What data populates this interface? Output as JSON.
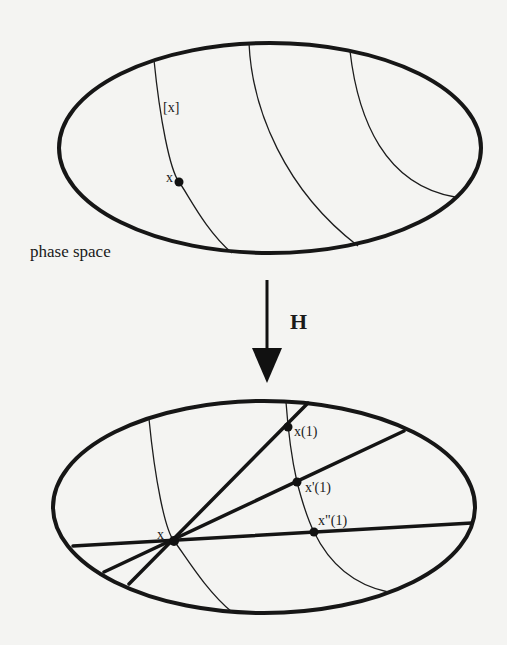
{
  "figure": {
    "top_panel": {
      "caption": "phase space",
      "fiber_label": "[x]",
      "point_label": "x"
    },
    "map": {
      "label": "H"
    },
    "bottom_panel": {
      "point_label": "x",
      "image_labels": [
        "x(1)",
        "x'(1)",
        "x\"(1)"
      ]
    },
    "colors": {
      "background": "#f4f4f2",
      "ink": "#161616"
    }
  }
}
